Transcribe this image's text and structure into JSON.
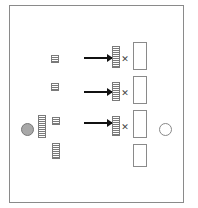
{
  "diagram": {
    "colors": {
      "frame": "#8a8a8a",
      "ladder": "#7a7a7a",
      "arrow": "#111111",
      "filled_circle": "#a8a8a8",
      "open_circle": "#888888"
    },
    "frame": {
      "x": 9,
      "y": 5,
      "w": 175,
      "h": 198
    },
    "small_ladders": [
      {
        "x": 51,
        "y": 55,
        "w": 8,
        "h": 8
      },
      {
        "x": 51,
        "y": 83,
        "w": 8,
        "h": 8
      },
      {
        "x": 52,
        "y": 117,
        "w": 8,
        "h": 8
      },
      {
        "x": 52,
        "y": 143,
        "w": 8,
        "h": 16
      }
    ],
    "left_tall_ladder": {
      "x": 38,
      "y": 115,
      "w": 8,
      "h": 23
    },
    "filled_circle": {
      "x": 21,
      "y": 123,
      "d": 13
    },
    "arrows": [
      {
        "x": 84,
        "y": 57,
        "len": 28
      },
      {
        "x": 84,
        "y": 91,
        "len": 28
      },
      {
        "x": 84,
        "y": 122,
        "len": 28
      }
    ],
    "target_ladders": [
      {
        "x": 112,
        "y": 46,
        "w": 8,
        "h": 22
      },
      {
        "x": 112,
        "y": 82,
        "w": 8,
        "h": 19
      },
      {
        "x": 112,
        "y": 116,
        "w": 8,
        "h": 20
      }
    ],
    "x_marks": [
      {
        "x": 121,
        "y": 55,
        "symbol": "✕"
      },
      {
        "x": 121,
        "y": 89,
        "symbol": "✕"
      },
      {
        "x": 121,
        "y": 123,
        "symbol": "✕"
      }
    ],
    "slots": [
      {
        "x": 133,
        "y": 42,
        "w": 14,
        "h": 28
      },
      {
        "x": 133,
        "y": 76,
        "w": 14,
        "h": 28
      },
      {
        "x": 133,
        "y": 110,
        "w": 14,
        "h": 28
      },
      {
        "x": 133,
        "y": 144,
        "w": 14,
        "h": 23
      }
    ],
    "open_circle": {
      "x": 159,
      "y": 123,
      "d": 13
    }
  }
}
